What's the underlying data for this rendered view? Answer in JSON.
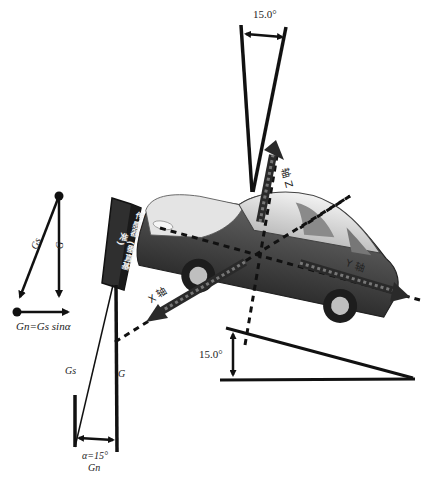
{
  "diagram": {
    "top_angle": {
      "label": "15.0°",
      "description": "Z-axis tilt indicator (V-shaped wedge at top)"
    },
    "right_angle": {
      "label": "15.0°",
      "description": "Ground inclination triangle indicator"
    },
    "bottom_angle": {
      "label": "α=15°",
      "sub_label": "Gn"
    },
    "vector_decomposition": {
      "gs_label": "Gs",
      "g_label": "G",
      "formula": "Gn=Gs sinα"
    },
    "sensor": {
      "line1": "传感器",
      "line2": "(垂直基准)"
    },
    "axes": {
      "x_axis": "X 轴",
      "y_axis": "Y 轴",
      "z_axis": "轴 Z"
    },
    "lower_labels": {
      "gs": "Gs",
      "g": "G",
      "alpha": "α=15°",
      "gn": "Gn"
    },
    "colors": {
      "line": "#111111",
      "car_body_dark": "#3a3a3a",
      "car_body_mid": "#6a6a6a",
      "car_roof_light": "#d8d8d8",
      "sensor_fill": "#2f2f2f",
      "axis_arrow": "#2a2a2a"
    }
  }
}
